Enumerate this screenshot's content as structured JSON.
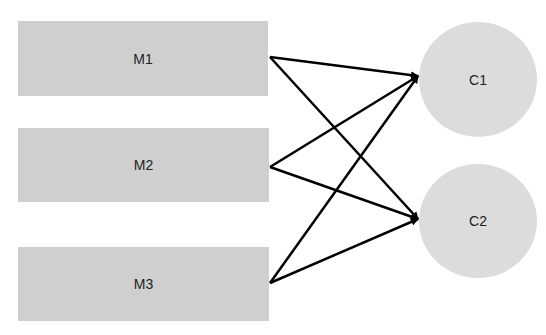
{
  "diagram": {
    "sources": [
      {
        "id": "M1",
        "label": "M1"
      },
      {
        "id": "M2",
        "label": "M2"
      },
      {
        "id": "M3",
        "label": "M3"
      }
    ],
    "targets": [
      {
        "id": "C1",
        "label": "C1"
      },
      {
        "id": "C2",
        "label": "C2"
      }
    ],
    "edges": [
      {
        "from": "M1",
        "to": "C1"
      },
      {
        "from": "M1",
        "to": "C2"
      },
      {
        "from": "M2",
        "to": "C1"
      },
      {
        "from": "M2",
        "to": "C2"
      },
      {
        "from": "M3",
        "to": "C1"
      },
      {
        "from": "M3",
        "to": "C2"
      }
    ],
    "colors": {
      "box": "#cfcfcf",
      "circle": "#dcdcdc",
      "edge": "#000000"
    }
  }
}
